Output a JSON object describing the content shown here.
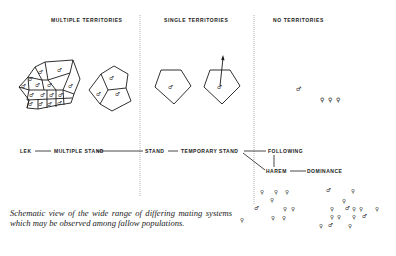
{
  "headers": {
    "multiple": "MULTIPLE TERRITORIES",
    "single": "SINGLE TERRITORIES",
    "none": "NO TERRITORIES"
  },
  "flow": {
    "lek": "LEK",
    "multiple_stand": "MULTIPLE STAND",
    "stand": "STAND",
    "temporary_stand": "TEMPORARY STAND",
    "following": "FOLLOWING",
    "harem": "HAREM",
    "dominance": "DOMINANCE"
  },
  "symbols": {
    "male": "♂",
    "female": "♀"
  },
  "caption": "Schematic view of the wide range of differing mating systems which may be observed among fallow populations.",
  "colors": {
    "ink": "#1a1a1a",
    "divider": "#9a9a9a",
    "background": "#ffffff"
  }
}
